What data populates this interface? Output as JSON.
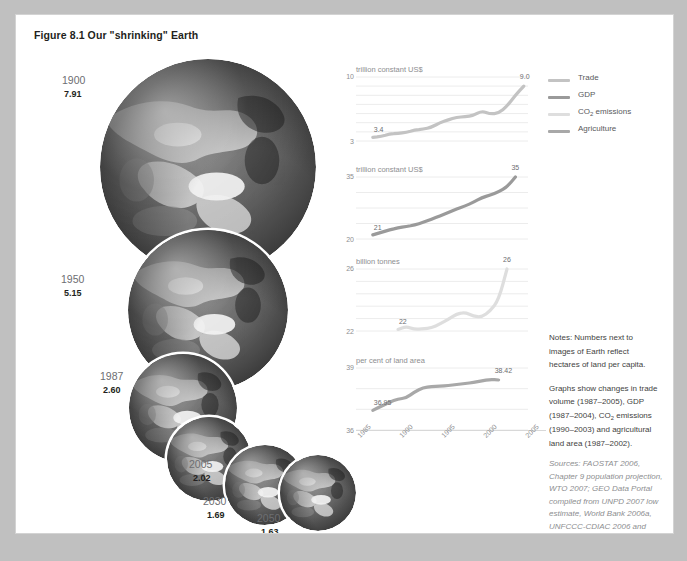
{
  "figure": {
    "title": "Figure 8.1 Our \"shrinking\" Earth"
  },
  "globes": [
    {
      "year": "1900",
      "value": "7.91"
    },
    {
      "year": "1950",
      "value": "5.15"
    },
    {
      "year": "1987",
      "value": "2.60"
    },
    {
      "year": "2005",
      "value": "2.02"
    },
    {
      "year": "2030",
      "value": "1.69"
    },
    {
      "year": "2050",
      "value": "1.63"
    }
  ],
  "legend": {
    "position": "right",
    "items": [
      {
        "label": "Trade",
        "color": "#c3c3c3"
      },
      {
        "label": "GDP",
        "color": "#9a9a9a"
      },
      {
        "label": "CO2 emissions",
        "label_html": "CO<sub>2</sub> emissions",
        "color": "#dedede"
      },
      {
        "label": "Agriculture",
        "color": "#a8a8a8"
      }
    ]
  },
  "chart_data": [
    {
      "type": "line",
      "name": "Trade",
      "title": "",
      "unit_label": "trillion constant US$",
      "ylabel": "trillion constant US$",
      "xlabel": "",
      "ylim": [
        3,
        10
      ],
      "ytick_labels": [
        "10",
        "3"
      ],
      "grid": true,
      "color": "#c3c3c3",
      "start_label": "3.4",
      "end_label": "9.0",
      "x": [
        1987,
        1988,
        1989,
        1990,
        1991,
        1992,
        1993,
        1994,
        1995,
        1996,
        1997,
        1998,
        1999,
        2000,
        2001,
        2002,
        2003,
        2004,
        2005
      ],
      "values": [
        3.4,
        3.5,
        3.75,
        3.85,
        3.95,
        4.2,
        4.3,
        4.5,
        5.0,
        5.3,
        5.6,
        5.65,
        5.8,
        6.3,
        5.95,
        6.05,
        6.8,
        8.0,
        9.0
      ]
    },
    {
      "type": "line",
      "name": "GDP",
      "title": "",
      "unit_label": "trillion constant US$",
      "ylabel": "trillion constant US$",
      "xlabel": "",
      "ylim": [
        20,
        35
      ],
      "ytick_labels": [
        "35",
        "20"
      ],
      "grid": true,
      "color": "#9a9a9a",
      "start_label": "21",
      "end_label": "35",
      "x": [
        1987,
        1988,
        1989,
        1990,
        1991,
        1992,
        1993,
        1994,
        1995,
        1996,
        1997,
        1998,
        1999,
        2000,
        2001,
        2002,
        2003,
        2004
      ],
      "values": [
        21.0,
        21.6,
        22.2,
        22.7,
        23.0,
        23.4,
        24.0,
        24.8,
        25.6,
        26.4,
        27.3,
        28.0,
        28.9,
        30.0,
        30.6,
        31.4,
        32.6,
        35.0
      ]
    },
    {
      "type": "line",
      "name": "CO2 emissions",
      "title": "",
      "unit_label": "billion tonnes",
      "ylabel": "billion tonnes",
      "xlabel": "",
      "ylim": [
        22,
        26
      ],
      "ytick_labels": [
        "26",
        "22"
      ],
      "grid": true,
      "color": "#dedede",
      "start_label": "22",
      "end_label": "26",
      "x": [
        1990,
        1991,
        1992,
        1993,
        1994,
        1995,
        1996,
        1997,
        1998,
        1999,
        2000,
        2001,
        2002,
        2003
      ],
      "values": [
        22.1,
        22.3,
        22.1,
        22.15,
        22.2,
        22.45,
        22.75,
        23.1,
        23.2,
        22.95,
        22.9,
        23.3,
        24.0,
        26.0
      ]
    },
    {
      "type": "line",
      "name": "Agriculture",
      "title": "",
      "unit_label": "per cent of land area",
      "ylabel": "per cent of land area",
      "xlabel": "",
      "ylim": [
        36,
        39
      ],
      "ytick_labels": [
        "39",
        "36"
      ],
      "grid": true,
      "color": "#a8a8a8",
      "start_label": "36.95",
      "end_label": "38.42",
      "x": [
        1987,
        1988,
        1989,
        1990,
        1991,
        1992,
        1993,
        1994,
        1995,
        1996,
        1997,
        1998,
        1999,
        2000,
        2001,
        2002
      ],
      "values": [
        36.95,
        37.15,
        37.35,
        37.5,
        37.55,
        37.85,
        38.05,
        38.1,
        38.12,
        38.15,
        38.2,
        38.25,
        38.3,
        38.38,
        38.45,
        38.42
      ],
      "xtick_labels": [
        "1985",
        "1990",
        "1995",
        "2000",
        "2005"
      ]
    }
  ],
  "notes": {
    "paragraph1": "Notes: Numbers next to images of Earth reflect hectares of land per capita.",
    "paragraph2": "Graphs show changes in trade volume (1987–2005), GDP (1987–2004), CO2 emissions (1990–2003) and agricultural land area (1987–2002).",
    "paragraph2_html": "Graphs show changes in trade volume (1987&ndash;2005), GDP (1987&ndash;2004), CO<sub>2</sub> emissions (1990&ndash;2003) and agricultural land area (1987&ndash;2002)."
  },
  "sources": {
    "text": "Sources: FAOSTAT 2006, Chapter 9 population projection, WTO 2007; GEO Data Portal compiled from UNPD 2007 low estimate, World Bank 2006a, UNFCCC-CDIAC 2006 and FAOSTAT 2004"
  }
}
